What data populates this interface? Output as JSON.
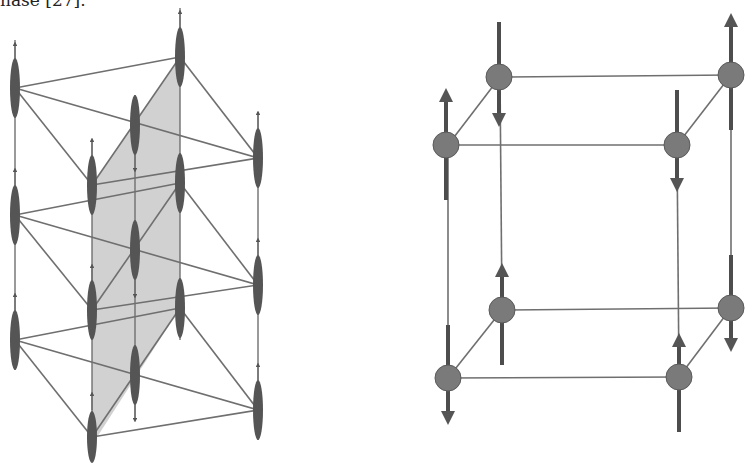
{
  "caption_fragment": "hase [27].",
  "figures": {
    "left": {
      "description": "3D lattice of chains with vertical spin moments and shaded diagonal plane",
      "plane_color": "#c9c9c9",
      "columns": [
        {
          "id": "A",
          "spin": "up"
        },
        {
          "id": "B",
          "spin": "up"
        },
        {
          "id": "C",
          "spin": "down"
        },
        {
          "id": "D",
          "spin": "up"
        },
        {
          "id": "E",
          "spin": "up"
        }
      ]
    },
    "right": {
      "description": "cubic unit cell with antiferromagnetic spin arrangement",
      "atoms": [
        {
          "position": "front-top-left",
          "spin": "up"
        },
        {
          "position": "back-top-left",
          "spin": "down"
        },
        {
          "position": "front-top-right",
          "spin": "down"
        },
        {
          "position": "back-top-right",
          "spin": "up"
        },
        {
          "position": "front-bottom-left",
          "spin": "down"
        },
        {
          "position": "back-bottom-left",
          "spin": "up"
        },
        {
          "position": "front-bottom-right",
          "spin": "up"
        },
        {
          "position": "back-bottom-right",
          "spin": "down"
        }
      ]
    }
  }
}
